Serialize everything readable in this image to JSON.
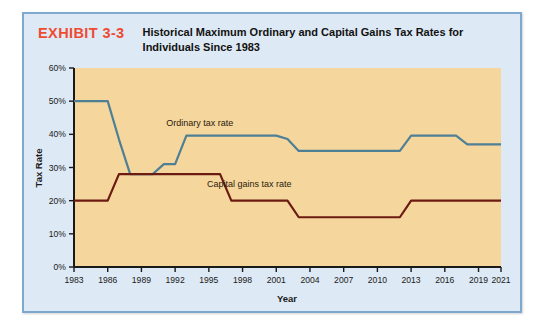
{
  "exhibit": {
    "tag": "EXHIBIT 3-3",
    "title": "Historical Maximum Ordinary and Capital Gains Tax Rates for Individuals Since 1983"
  },
  "colors": {
    "tag": "#EF4B33",
    "frame_bg": "#DDE9F4",
    "frame_border": "#7FA8CD",
    "plot_bg": "#F5D79E",
    "axis": "#1A1A1A",
    "ordinary_line": "#4E7F95",
    "capital_line": "#6B1B12"
  },
  "chart_data": {
    "type": "line",
    "title": "Historical Maximum Ordinary and Capital Gains Tax Rates for Individuals Since 1983",
    "xlabel": "Year",
    "ylabel": "Tax Rate",
    "xlim": [
      1983,
      2021
    ],
    "ylim": [
      0,
      60
    ],
    "grid": false,
    "legend_position": "inline-annotation",
    "x_tick_labels": [
      "1983",
      "1986",
      "1989",
      "1992",
      "1995",
      "1998",
      "2001",
      "2004",
      "2007",
      "2010",
      "2013",
      "2016",
      "2019",
      "2021"
    ],
    "x_ticks": [
      1983,
      1986,
      1989,
      1992,
      1995,
      1998,
      2001,
      2004,
      2007,
      2010,
      2013,
      2016,
      2019,
      2021
    ],
    "y_tick_labels": [
      "0%",
      "10%",
      "20%",
      "30%",
      "40%",
      "50%",
      "60%"
    ],
    "y_ticks": [
      0,
      10,
      20,
      30,
      40,
      50,
      60
    ],
    "annotations": [
      {
        "text": "Ordinary tax rate",
        "x": 1994.2,
        "y": 42.5
      },
      {
        "text": "Capital gains tax rate",
        "x": 1998.6,
        "y": 24.2
      }
    ],
    "series": [
      {
        "name": "Ordinary tax rate",
        "color": "#4E7F95",
        "x": [
          1983,
          1986,
          1987,
          1988,
          1990,
          1991,
          1992,
          1993,
          2001,
          2002,
          2003,
          2012,
          2013,
          2017,
          2018,
          2021
        ],
        "values": [
          50,
          50,
          38.5,
          28,
          28,
          31,
          31,
          39.6,
          39.6,
          38.6,
          35,
          35,
          39.6,
          39.6,
          37,
          37
        ]
      },
      {
        "name": "Capital gains tax rate",
        "color": "#6B1B12",
        "x": [
          1983,
          1986,
          1987,
          1988,
          1996,
          1997,
          2002,
          2003,
          2012,
          2013,
          2021
        ],
        "values": [
          20,
          20,
          28,
          28,
          28,
          20,
          20,
          15,
          15,
          20,
          20
        ]
      }
    ]
  }
}
